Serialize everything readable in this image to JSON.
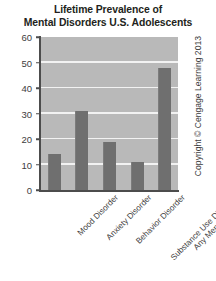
{
  "title": {
    "line1": "Lifetime Prevalence of",
    "line2": "Mental Disorders U.S. Adolescents"
  },
  "copyright": "Copyright © Cengage Learning 2013",
  "colors": {
    "plot_background": "#b9b9b9",
    "gridline": "#f2f2f2",
    "bar": "#6f6f6f",
    "axis": "#4c4c4c",
    "text": "#231f20"
  },
  "chart_data": {
    "type": "bar",
    "title": "Lifetime Prevalence of Mental Disorders U.S. Adolescents",
    "xlabel": "",
    "ylabel": "",
    "categories": [
      "Mood Disorder",
      "Anxiety Disorder",
      "Behavior Disorder",
      "Substance Use Disorder",
      "Any Mental Disorder"
    ],
    "values": [
      14,
      31,
      19,
      11,
      48
    ],
    "ylim": [
      0,
      60
    ],
    "yticks": [
      0,
      10,
      20,
      30,
      40,
      50,
      60
    ],
    "ytick_labels": [
      "0",
      "10",
      "20",
      "30",
      "40",
      "50",
      "60"
    ],
    "grid": true,
    "legend": false
  }
}
